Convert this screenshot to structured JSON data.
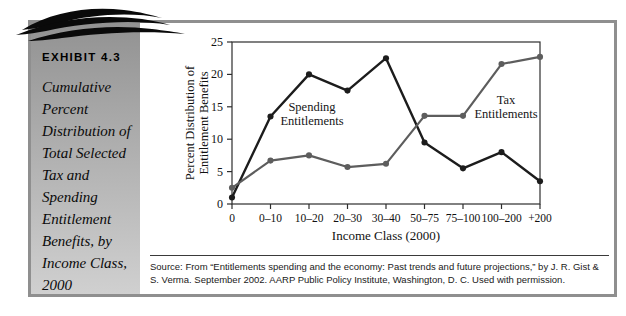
{
  "exhibit": {
    "label": "EXHIBIT 4.3",
    "title": "Cumulative Percent Distribution of Total Selected Tax and Spending Entitlement Benefits, by Income Class, 2000"
  },
  "source": {
    "line1": "Source: From “Entitlements spending and the economy: Past trends and future projections,” by J. R. Gist &",
    "line2": "S. Verma. September 2002. AARP Public Policy Institute, Washington, D. C. Used with permission."
  },
  "colors": {
    "spending_line": "#1c1c1c",
    "tax_line": "#5d5d5d",
    "axis": "#2e2e2e",
    "frame_border": "#8f8f8f"
  },
  "chart_data": {
    "type": "line",
    "title": "",
    "categories": [
      "0",
      "0–10",
      "10–20",
      "20–30",
      "30–40",
      "50–75",
      "75–100",
      "100–200",
      "+200"
    ],
    "series": [
      {
        "name": "Spending Entitlements",
        "color": "#1c1c1c",
        "values": [
          1.0,
          13.5,
          20.0,
          17.5,
          22.5,
          9.5,
          5.5,
          8.0,
          3.5
        ]
      },
      {
        "name": "Tax Entitlements",
        "color": "#5d5d5d",
        "values": [
          2.5,
          6.7,
          7.5,
          5.7,
          6.2,
          13.6,
          13.6,
          21.6,
          22.7
        ]
      }
    ],
    "annotations": [
      {
        "lines": [
          "Spending",
          "Entitlements"
        ]
      },
      {
        "lines": [
          "Tax",
          "Entitlements"
        ]
      }
    ],
    "xlabel": "Income Class (2000)",
    "ylabel_lines": [
      "Percent Distribution of",
      "Entitlement Benefits"
    ],
    "ylim": [
      0,
      25
    ],
    "ytick_step": 5,
    "grid": false,
    "legend": "inline-annotations"
  }
}
